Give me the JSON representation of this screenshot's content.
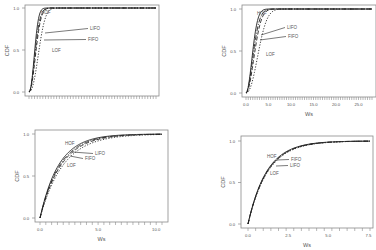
{
  "figure": {
    "background": "#ffffff",
    "frame_color": "#8a8a8a",
    "line_color": "#222222"
  },
  "chart_data": [
    {
      "id": "top-left",
      "type": "line",
      "title": "",
      "xlabel": "",
      "ylabel": "CDF",
      "xlim": [
        0,
        30
      ],
      "ylim": [
        0,
        1
      ],
      "xticks": [],
      "xtick_labels": [],
      "minor_xticks": 46,
      "yticks": [
        0.0,
        0.5,
        1.0
      ],
      "ytick_labels": [
        "0.0",
        "0.5",
        "1.0"
      ],
      "grid": false,
      "legend": "inline annotations",
      "frame": {
        "x0": 25,
        "x1": 159,
        "y_top": 5,
        "y_bottom": 96,
        "px_x0": 29,
        "px_x1": 156,
        "px_y0": 92,
        "px_y1": 8
      },
      "series": [
        {
          "name": "HOF",
          "style": "solid",
          "rate": 0.62,
          "shape": 2.2
        },
        {
          "name": "LIFO",
          "style": "dashdot",
          "rate": 0.55,
          "shape": 2.0
        },
        {
          "name": "FIFO",
          "style": "dashed",
          "rate": 0.5,
          "shape": 2.1
        },
        {
          "name": "LOF",
          "style": "dotted",
          "rate": 0.36,
          "shape": 2.3
        }
      ],
      "annotations": [
        {
          "label": "HOF",
          "tx": 41,
          "ty": 14,
          "ax": 58,
          "ay": 11,
          "line": false
        },
        {
          "label": "LIFO",
          "tx": 90,
          "ty": 30,
          "ax": 45,
          "ay": 33,
          "line": true
        },
        {
          "label": "FIFO",
          "tx": 88,
          "ty": 41,
          "ax": 44,
          "ay": 40,
          "line": true
        },
        {
          "label": "LOF",
          "tx": 52,
          "ty": 52,
          "ax": 0,
          "ay": 0,
          "line": false
        }
      ]
    },
    {
      "id": "top-right",
      "type": "line",
      "title": "",
      "xlabel": "Ws",
      "ylabel": "CDF",
      "xlim": [
        0,
        28
      ],
      "ylim": [
        0,
        1
      ],
      "xticks": [
        0,
        5,
        10,
        15,
        20,
        25
      ],
      "xtick_labels": [
        "0.0",
        "5.0",
        "10.0",
        "15.0",
        "20.0",
        "25.0"
      ],
      "minor_xticks": 56,
      "yticks": [
        0.0,
        0.5,
        1.0
      ],
      "ytick_labels": [
        "0.0",
        "0.5",
        "1.0"
      ],
      "grid": false,
      "legend": "inline annotations",
      "frame": {
        "x0": 242,
        "x1": 376,
        "y_top": 5,
        "y_bottom": 97,
        "px_x0": 246,
        "px_x1": 372,
        "px_y0": 93,
        "px_y1": 9
      },
      "series": [
        {
          "name": "HOF",
          "style": "solid",
          "rate": 0.55,
          "shape": 2.0
        },
        {
          "name": "LIFO",
          "style": "dashdot",
          "rate": 0.48,
          "shape": 1.9
        },
        {
          "name": "FIFO",
          "style": "dashed",
          "rate": 0.42,
          "shape": 2.0
        },
        {
          "name": "LOF",
          "style": "dotted",
          "rate": 0.3,
          "shape": 2.2
        }
      ],
      "annotations": [
        {
          "label": "HOF",
          "tx": 257,
          "ty": 15,
          "ax": 0,
          "ay": 0,
          "line": false
        },
        {
          "label": "LIFO",
          "tx": 287,
          "ty": 29,
          "ax": 261,
          "ay": 35,
          "line": true
        },
        {
          "label": "FIFO",
          "tx": 288,
          "ty": 38,
          "ax": 260,
          "ay": 40,
          "line": true
        },
        {
          "label": "LOF",
          "tx": 266,
          "ty": 56,
          "ax": 0,
          "ay": 0,
          "line": false
        }
      ]
    },
    {
      "id": "bottom-left",
      "type": "line",
      "title": "",
      "xlabel": "Ws",
      "ylabel": "CDF",
      "xlim": [
        0,
        10.5
      ],
      "ylim": [
        0,
        1
      ],
      "xticks": [
        0,
        5,
        10
      ],
      "xtick_labels": [
        "0.0",
        "5.0",
        "10.0"
      ],
      "minor_xticks": 21,
      "yticks": [
        0.0,
        0.5,
        1.0
      ],
      "ytick_labels": [
        "0.0",
        "0.5",
        "1.0"
      ],
      "grid": false,
      "legend": "inline annotations",
      "frame": {
        "x0": 35,
        "x1": 168,
        "y_top": 130,
        "y_bottom": 222,
        "px_x0": 40,
        "px_x1": 162,
        "px_y0": 218,
        "px_y1": 134
      },
      "series": [
        {
          "name": "HOF",
          "style": "solid",
          "rate": 0.62,
          "shape": 1.0
        },
        {
          "name": "LIFO",
          "style": "dashdot",
          "rate": 0.58,
          "shape": 1.0
        },
        {
          "name": "FIFO",
          "style": "dashed",
          "rate": 0.55,
          "shape": 1.0
        },
        {
          "name": "LOF",
          "style": "dotted",
          "rate": 0.5,
          "shape": 1.0
        }
      ],
      "annotations": [
        {
          "label": "HOF",
          "tx": 65,
          "ty": 145,
          "ax": 0,
          "ay": 0,
          "line": false
        },
        {
          "label": "LIFO",
          "tx": 95,
          "ty": 155,
          "ax": 72,
          "ay": 152,
          "line": true
        },
        {
          "label": "FIFO",
          "tx": 85,
          "ty": 160,
          "ax": 70,
          "ay": 156,
          "line": true
        },
        {
          "label": "LOF",
          "tx": 67,
          "ty": 167,
          "ax": 0,
          "ay": 0,
          "line": false
        }
      ]
    },
    {
      "id": "bottom-right",
      "type": "line",
      "title": "",
      "xlabel": "Ws",
      "ylabel": "CDF",
      "xlim": [
        0,
        7.6
      ],
      "ylim": [
        0,
        1
      ],
      "xticks": [
        0,
        2.5,
        5,
        7.5
      ],
      "xtick_labels": [
        "0.0",
        "2.5",
        "5.0",
        "7.5"
      ],
      "minor_xticks": 16,
      "yticks": [
        0.0,
        0.5,
        1.0
      ],
      "ytick_labels": [
        "0.0",
        "0.5",
        "1.0"
      ],
      "grid": false,
      "legend": "inline annotations",
      "frame": {
        "x0": 241,
        "x1": 373,
        "y_top": 136,
        "y_bottom": 228,
        "px_x0": 248,
        "px_x1": 370,
        "px_y0": 224,
        "px_y1": 141
      },
      "series": [
        {
          "name": "HOF",
          "style": "solid",
          "rate": 0.86,
          "shape": 1.0
        },
        {
          "name": "FIFO",
          "style": "dashdot",
          "rate": 0.84,
          "shape": 1.0
        },
        {
          "name": "LIFO",
          "style": "dashed",
          "rate": 0.83,
          "shape": 1.0
        },
        {
          "name": "LOF",
          "style": "dotted",
          "rate": 0.81,
          "shape": 1.0
        }
      ],
      "annotations": [
        {
          "label": "HOF",
          "tx": 267,
          "ty": 158,
          "ax": 0,
          "ay": 0,
          "line": false
        },
        {
          "label": "FIFO",
          "tx": 291,
          "ty": 161,
          "ax": 277,
          "ay": 160,
          "line": true
        },
        {
          "label": "LIFO",
          "tx": 290,
          "ty": 167,
          "ax": 276,
          "ay": 166,
          "line": true
        },
        {
          "label": "LOF",
          "tx": 270,
          "ty": 175,
          "ax": 0,
          "ay": 0,
          "line": false
        }
      ]
    }
  ]
}
